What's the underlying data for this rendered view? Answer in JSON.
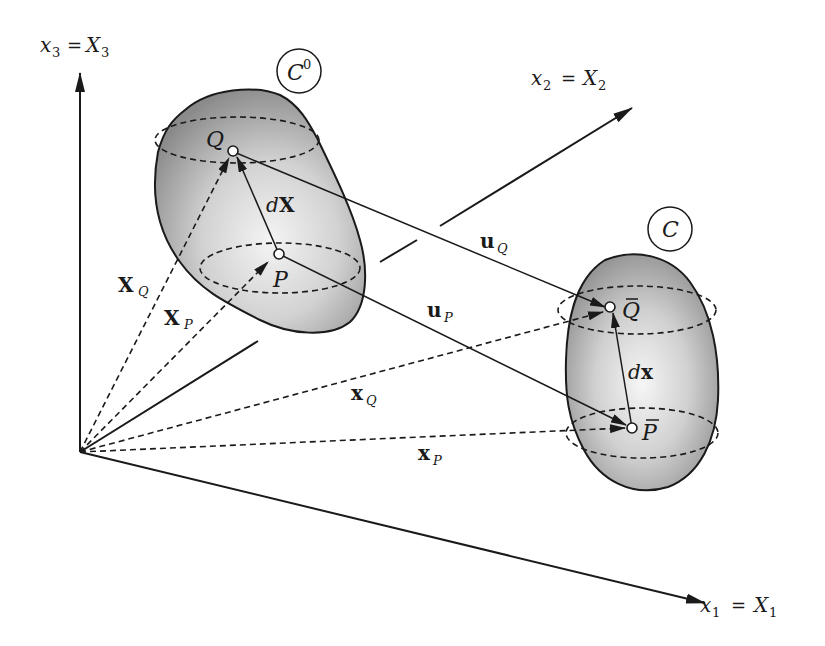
{
  "figure": {
    "colors": {
      "ink": "#1a1a1a",
      "body_shade_dark": "#8c8c8c",
      "body_shade_light": "#f2f2f2",
      "background": "#ffffff"
    }
  },
  "axes": {
    "x1": {
      "label_left": "x",
      "label_left_sub": "1",
      "eq": "=",
      "label_right": "X",
      "label_right_sub": "1"
    },
    "x2": {
      "label_left": "x",
      "label_left_sub": "2",
      "eq": "=",
      "label_right": "X",
      "label_right_sub": "2"
    },
    "x3": {
      "label_left": "x",
      "label_left_sub": "3",
      "eq": "=",
      "label_right": "X",
      "label_right_sub": "3"
    }
  },
  "configurations": {
    "reference": {
      "name": "C",
      "superscript": "0"
    },
    "current": {
      "name": "C"
    }
  },
  "points": {
    "Q": "Q",
    "P": "P",
    "Q_bar": "Q",
    "P_bar": "P",
    "bar": "‾"
  },
  "vectors": {
    "dX": {
      "prefix": "d",
      "main": "X"
    },
    "dx": {
      "prefix": "d",
      "main": "x"
    },
    "XQ": {
      "main": "X",
      "sub": "Q"
    },
    "XP": {
      "main": "X",
      "sub": "P"
    },
    "xQ": {
      "main": "x",
      "sub": "Q"
    },
    "xP": {
      "main": "x",
      "sub": "P"
    },
    "uQ": {
      "main": "u",
      "sub": "Q"
    },
    "uP": {
      "main": "u",
      "sub": "P"
    }
  }
}
